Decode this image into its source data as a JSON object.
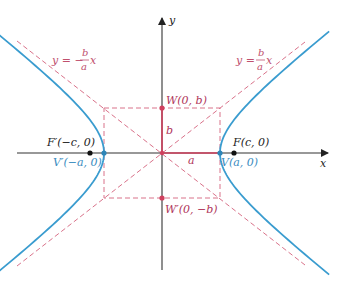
{
  "diagram": {
    "type": "hyperbola",
    "colors": {
      "hyperbola": "#3a9ccf",
      "asymptote": "#d9728a",
      "segment": "#d0405e",
      "axis": "#333333",
      "vertex_label": "#3a8cc0",
      "covertex_label": "#b0365a",
      "focus": "#111111"
    },
    "axes": {
      "x_label": "x",
      "y_label": "y"
    },
    "asymptotes": {
      "positive": {
        "lhs": "y =",
        "num": "b",
        "den": "a",
        "var": "x"
      },
      "negative": {
        "lhs": "y = −",
        "num": "b",
        "den": "a",
        "var": "x"
      }
    },
    "points": {
      "focus_right": "F(c, 0)",
      "focus_left": "F′(−c, 0)",
      "vertex_right": "V(a, 0)",
      "vertex_left": "V′(−a, 0)",
      "covertex_top": "W(0, b)",
      "covertex_bottom": "W′(0, −b)"
    },
    "segments": {
      "semi_major": "a",
      "semi_minor": "b"
    }
  }
}
